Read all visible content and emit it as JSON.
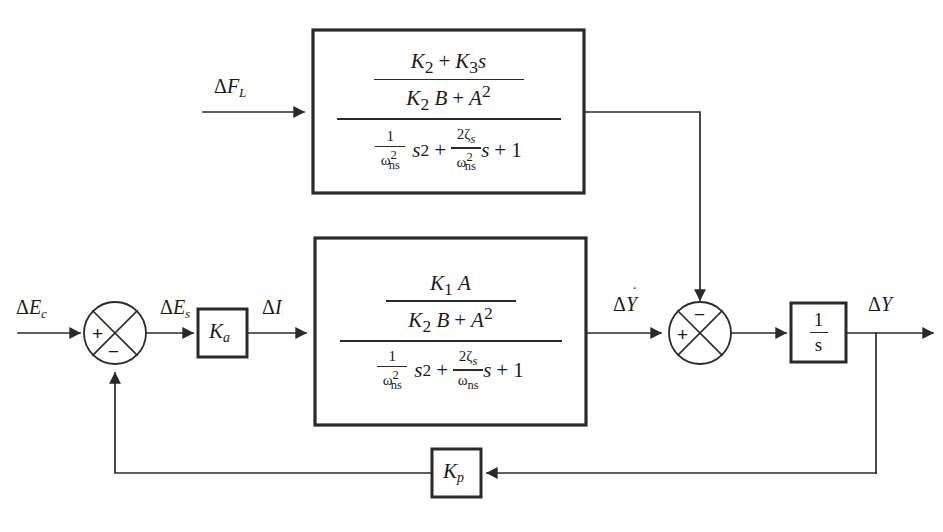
{
  "figure": {
    "type": "control-system-block-diagram",
    "caption": "",
    "background_color": "#ffffff",
    "line_color": "#2a2a2a",
    "text_color": "#1a1a1a"
  },
  "signals": {
    "input_command": "ΔE",
    "input_command_sub": "c",
    "error": "ΔE",
    "error_sub": "s",
    "current": "ΔI",
    "load_force": "ΔF",
    "load_force_sub": "L",
    "velocity": "ΔẎ",
    "output": "ΔY"
  },
  "labels": {
    "input_command": "ΔE_c",
    "error": "ΔE_s",
    "current": "ΔI",
    "load_force": "ΔF_L",
    "velocity": "ΔẎ",
    "output": "ΔY"
  },
  "gain_blocks": [
    {
      "name": "amplifier-gain",
      "symbol": "K",
      "subscript": "a",
      "label": "K_a"
    },
    {
      "name": "integrator",
      "symbol": "1/s",
      "numerator": "1",
      "denominator": "s",
      "label": "1/s"
    },
    {
      "name": "feedback-gain",
      "symbol": "K",
      "subscript": "p",
      "label": "K_p"
    }
  ],
  "transfer_blocks": [
    {
      "name": "load-disturbance-transfer-function",
      "label": "load disturbance path",
      "numerator": {
        "numerator": "K₂ + K₃s",
        "denominator": "K₂B + A²",
        "terms": [
          {
            "sym": "K",
            "sub": "2"
          },
          {
            "op": "+"
          },
          {
            "sym": "K",
            "sub": "3"
          },
          {
            "sym": "s"
          }
        ],
        "den_terms": [
          {
            "sym": "K",
            "sub": "2"
          },
          {
            "sym": "B"
          },
          {
            "op": "+"
          },
          {
            "sym": "A",
            "sup": "2"
          }
        ]
      },
      "denominator": {
        "text": "(1/ω²ns)s² + (2ζs/ω²ns)s + 1",
        "term1_num": "1",
        "term1_den_sym": "ω",
        "term1_den_sup": "2",
        "term1_den_sub": "ns",
        "term1_mult": "s",
        "term1_mult_sup": "2",
        "op1": "+",
        "term2_num_coef": "2",
        "term2_num_sym": "ζ",
        "term2_num_sub": "s",
        "term2_den_sym": "ω",
        "term2_den_sup": "2",
        "term2_den_sub": "ns",
        "term2_mult": "s",
        "op2": "+",
        "term3": "1"
      }
    },
    {
      "name": "forward-path-transfer-function",
      "label": "forward path",
      "numerator": {
        "numerator": "K₁A",
        "denominator": "K₂B + A²",
        "terms": [
          {
            "sym": "K",
            "sub": "1"
          },
          {
            "sym": "A"
          }
        ],
        "den_terms": [
          {
            "sym": "K",
            "sub": "2"
          },
          {
            "sym": "B"
          },
          {
            "op": "+"
          },
          {
            "sym": "A",
            "sup": "2"
          }
        ]
      },
      "denominator": {
        "text": "(1/ω²ns)s² + (2ζs/ωns)s + 1",
        "term1_num": "1",
        "term1_den_sym": "ω",
        "term1_den_sup": "2",
        "term1_den_sub": "ns",
        "term1_mult": "s",
        "term1_mult_sup": "2",
        "op1": "+",
        "term2_num_coef": "2",
        "term2_num_sym": "ζ",
        "term2_num_sub": "s",
        "term2_den_sym": "ω",
        "term2_den_sup": "",
        "term2_den_sub": "ns",
        "term2_mult": "s",
        "op2": "+",
        "term3": "1"
      }
    }
  ],
  "summing_junctions": [
    {
      "name": "error-summing-junction",
      "signs": {
        "left": "+",
        "bottom": "−"
      }
    },
    {
      "name": "velocity-summing-junction",
      "signs": {
        "left": "+",
        "top": "−"
      }
    }
  ],
  "symbols": {
    "plus": "+",
    "minus": "−",
    "delta": "Δ"
  }
}
